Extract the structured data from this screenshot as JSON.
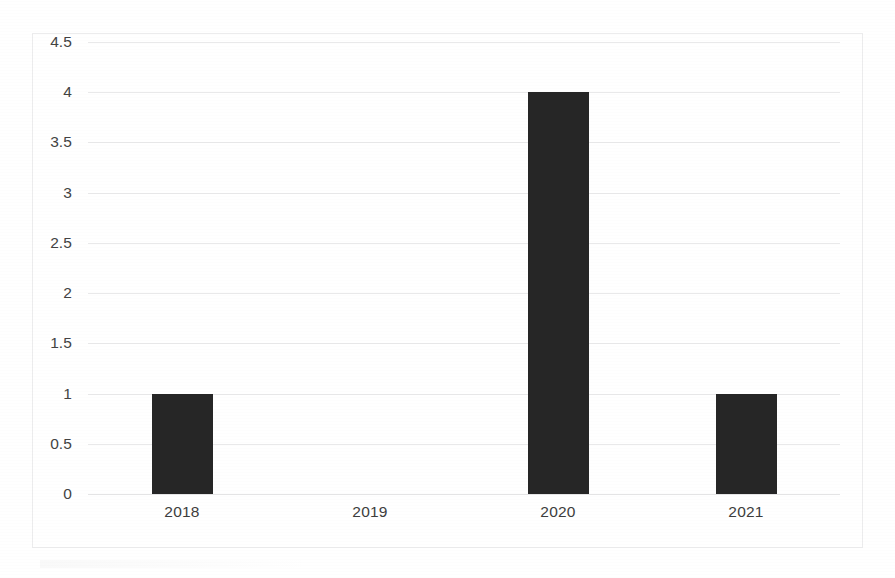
{
  "chart_data": {
    "type": "bar",
    "title": "",
    "subtitle": "",
    "xlabel": "",
    "ylabel": "",
    "categories": [
      "2018",
      "2019",
      "2020",
      "2021"
    ],
    "values": [
      1,
      0,
      4,
      1
    ],
    "series": [
      {
        "name": "",
        "values": [
          1,
          0,
          4,
          1
        ]
      }
    ],
    "ylim": [
      0,
      4.5
    ],
    "ytick_labels": [
      "4.5",
      "4",
      "3.5",
      "3",
      "2.5",
      "2",
      "1.5",
      "1",
      "0.5",
      "0"
    ],
    "ytick_values": [
      4.5,
      4,
      3.5,
      3,
      2.5,
      2,
      1.5,
      1,
      0.5,
      0
    ],
    "ytick_step": 0.5,
    "grid": true,
    "grid_axis": "y",
    "legend": false,
    "legend_position": "none",
    "annotations": [],
    "colors": {
      "bar": "#262626",
      "gridline": "#e9e9ea",
      "frame_border": "#ececed",
      "axis_text": "#434343",
      "category_text": "#3d3d3d",
      "background": "#ffffff"
    }
  }
}
